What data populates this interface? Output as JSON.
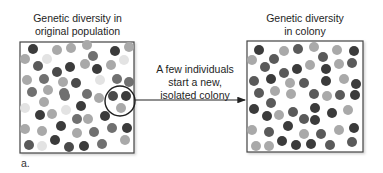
{
  "panel_label": "a.",
  "left_box": {
    "title_line1": "Genetic diversity in",
    "title_line2": "original population",
    "frame": {
      "x": 20,
      "y": 42,
      "w": 114,
      "h": 111
    },
    "circle": {
      "cx": 120,
      "cy": 101,
      "r": 15
    }
  },
  "right_box": {
    "title_line1": "Genetic diversity",
    "title_line2": "in colony",
    "frame": {
      "x": 247,
      "y": 41,
      "w": 116,
      "h": 111
    }
  },
  "arrow_text": {
    "line1": "A few individuals",
    "line2": "start a new,",
    "line3": "isolated colony"
  },
  "arrow": {
    "x1": 135,
    "y": 100,
    "x2": 245
  },
  "colors": {
    "dark": "#3b3b3b",
    "mid": "#707070",
    "light": "#a9a9a9",
    "pale": "#dadada",
    "border": "#444444"
  }
}
